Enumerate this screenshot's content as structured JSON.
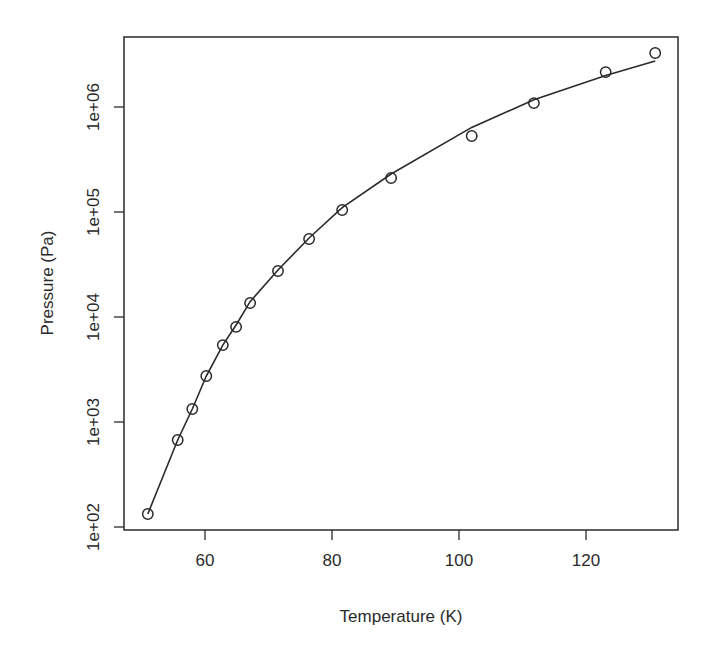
{
  "chart_data": {
    "type": "scatter",
    "title": "",
    "xlabel": "Temperature (K)",
    "ylabel": "Pressure (Pa)",
    "xscale": "linear",
    "yscale": "log",
    "xlim": [
      48,
      135
    ],
    "ylim": [
      100,
      4000000
    ],
    "grid": false,
    "legend": null,
    "x_ticks": [
      60,
      80,
      100,
      120
    ],
    "x_tick_labels": [
      "60",
      "80",
      "100",
      "120"
    ],
    "y_ticks": [
      100,
      1000,
      10000,
      100000,
      1000000
    ],
    "y_tick_labels": [
      "1e+02",
      "1e+03",
      "1e+04",
      "1e+05",
      "1e+06"
    ],
    "series": [
      {
        "name": "observed",
        "style": "open circles",
        "x": [
          51.0,
          55.7,
          58.0,
          60.2,
          62.8,
          64.9,
          67.1,
          71.5,
          76.4,
          81.6,
          89.3,
          102.0,
          111.8,
          123.1,
          130.9
        ],
        "y": [
          133,
          674,
          1330,
          2740,
          5400,
          8040,
          13600,
          27400,
          55300,
          104500,
          211000,
          530000,
          1090000,
          2150000,
          3270000
        ]
      },
      {
        "name": "fitted",
        "style": "solid line",
        "x": [
          51.0,
          55.7,
          58.0,
          60.2,
          62.8,
          64.9,
          67.1,
          71.5,
          76.4,
          81.6,
          89.3,
          102.0,
          111.8,
          123.1,
          130.9
        ],
        "y": [
          133,
          674,
          1330,
          2740,
          5400,
          8400,
          14000,
          28000,
          56500,
          110000,
          230000,
          640000,
          1170000,
          1990000,
          2750000
        ]
      }
    ]
  },
  "plot": {
    "frame": {
      "left": 124,
      "top": 37,
      "right": 678,
      "bottom": 530
    },
    "x_map": {
      "ref_value": 60,
      "ref_px": 205,
      "px_per_unit": 6.35
    },
    "y_map": {
      "ref_log": 6,
      "ref_px": 107,
      "px_per_decade": 105
    },
    "line_color": "#2a2a2a"
  }
}
